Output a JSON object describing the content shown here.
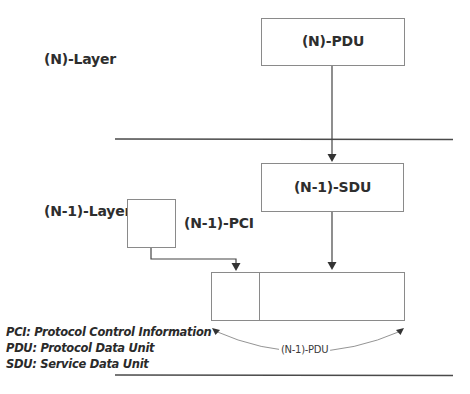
{
  "diagram": {
    "n_layer": {
      "label": "(N)-Layer",
      "pdu_box_label": "(N)-PDU"
    },
    "n_minus_1_layer": {
      "label": "(N-1)-Layer",
      "sdu_box_label": "(N-1)-SDU",
      "pci_label": "(N-1)-PCI",
      "pdu_span_label": "(N-1)-PDU"
    },
    "legend": [
      "PCI: Protocol Control Information",
      "PDU: Protocol Data Unit",
      "SDU: Service Data Unit"
    ],
    "colors": {
      "line": "#4a4a4a",
      "box_border": "#8a8a8a",
      "text": "#2e2e2e",
      "background": "#ffffff"
    }
  }
}
